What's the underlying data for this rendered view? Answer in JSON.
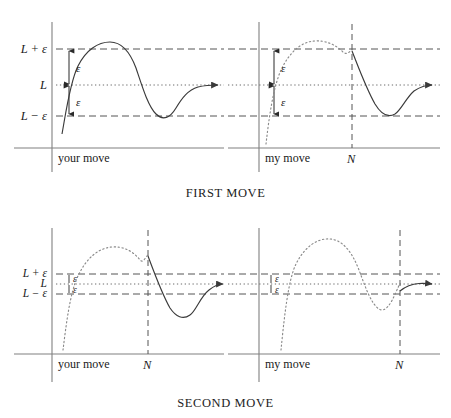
{
  "figure": {
    "captions": {
      "first": "FIRST MOVE",
      "second": "SECOND MOVE"
    },
    "colors": {
      "curve": "#3a3a3a",
      "axis": "#707070",
      "dashed": "#555555",
      "dotted": "#6a6a6a",
      "text": "#1a1a1a",
      "background": "#ffffff"
    },
    "labels": {
      "L_plus_eps": "L + ε",
      "L": "L",
      "L_minus_eps": "L − ε",
      "epsilon": "ε",
      "N": "N",
      "your_move": "your move",
      "my_move": "my move"
    }
  },
  "panels": [
    {
      "id": "top-left",
      "row": "first",
      "column": "left",
      "x_axis_label": "your move",
      "has_N": false,
      "N_label": "",
      "shows_L_labels": true,
      "band_labels": [
        "L + ε",
        "L",
        "L − ε"
      ],
      "epsilon_arrows": 2,
      "epsilon_label": "ε",
      "description": "Solid curve starts below L-ε at the origin, rises past L+ε, peaks above the band, descends below L-ε, then converges to L with a rightward arrow."
    },
    {
      "id": "top-right",
      "row": "first",
      "column": "right",
      "x_axis_label": "my move",
      "has_N": true,
      "N_label": "N",
      "shows_L_labels": false,
      "band_labels": [],
      "epsilon_arrows": 2,
      "epsilon_label": "ε",
      "description": "Dotted curve before N rises and peaks above the band; at N the curve becomes solid, drops below L-ε, then converges to L with a rightward arrow."
    },
    {
      "id": "bottom-left",
      "row": "second",
      "column": "left",
      "x_axis_label": "your move",
      "has_N": true,
      "N_label": "N",
      "shows_L_labels": true,
      "band_labels": [
        "L + ε",
        "L",
        "L − ε"
      ],
      "epsilon_arrows": 2,
      "epsilon_label": "ε",
      "description": "Narrow epsilon band. Dotted curve before N peaks far above the band; solid after N it drops below the band and converges to L with a rightward arrow."
    },
    {
      "id": "bottom-right",
      "row": "second",
      "column": "right",
      "x_axis_label": "my move",
      "has_N": true,
      "N_label": "N",
      "shows_L_labels": false,
      "band_labels": [],
      "epsilon_arrows": 2,
      "epsilon_label": "ε",
      "description": "Narrow epsilon band with N far to the right. Dotted curve oscillates above and below the band; only a short solid tail after N converges to L with a rightward arrow."
    }
  ]
}
